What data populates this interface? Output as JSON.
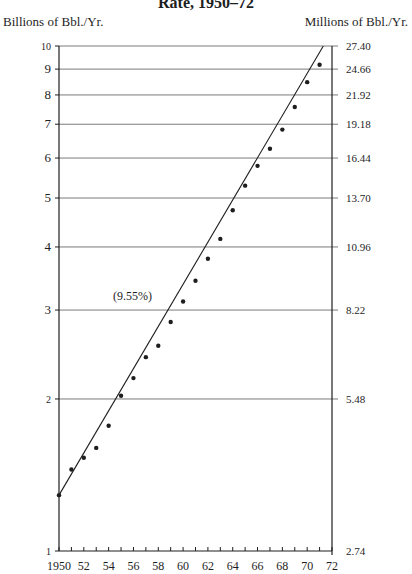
{
  "title": "Rate, 1950–72",
  "left_axis_title": "Billions of Bbl./Yr.",
  "right_axis_title": "Millions of Bbl./Yr.",
  "annotation": "(9.55%)",
  "colors": {
    "ink": "#1e1e1e",
    "grid": "#7a7a7a",
    "background": "#ffffff"
  },
  "chart_data": {
    "type": "scatter",
    "title": "Rate, 1950–72",
    "xlabel": "",
    "ylabel": "Billions of Bbl./Yr.",
    "ylabel_right": "Millions of Bbl./Yr.",
    "yscale": "log",
    "xlim": [
      1950,
      1972
    ],
    "ylim": [
      1,
      10
    ],
    "grid": "horizontal",
    "x_tick_labels": [
      "1950",
      "52",
      "54",
      "56",
      "58",
      "60",
      "62",
      "64",
      "66",
      "68",
      "70",
      "72"
    ],
    "x_ticks": [
      1950,
      1952,
      1954,
      1956,
      1958,
      1960,
      1962,
      1964,
      1966,
      1968,
      1970,
      1972
    ],
    "y_ticks_left": [
      1,
      2,
      3,
      4,
      5,
      6,
      7,
      8,
      9,
      10
    ],
    "y_tick_labels_left": [
      "1",
      "2",
      "3",
      "4",
      "5",
      "6",
      "7",
      "8",
      "9",
      "10"
    ],
    "y_tick_labels_right": [
      "2.74",
      "5.48",
      "8.22",
      "10.96",
      "13.70",
      "16.44",
      "19.18",
      "21.92",
      "24.66",
      "27.40"
    ],
    "series": [
      {
        "name": "Observed",
        "x": [
          1950,
          1951,
          1952,
          1953,
          1954,
          1955,
          1956,
          1957,
          1958,
          1959,
          1960,
          1961,
          1962,
          1963,
          1964,
          1965,
          1966,
          1967,
          1968,
          1969,
          1970,
          1971
        ],
        "values": [
          1.29,
          1.45,
          1.53,
          1.6,
          1.77,
          2.03,
          2.2,
          2.42,
          2.55,
          2.84,
          3.12,
          3.43,
          3.79,
          4.15,
          4.73,
          5.29,
          5.79,
          6.26,
          6.83,
          7.57,
          8.48,
          9.18
        ]
      },
      {
        "name": "Trend (9.55%)",
        "type": "line",
        "x": [
          1950,
          1971.3
        ],
        "values": [
          1.29,
          10.0
        ]
      }
    ],
    "annotations": [
      {
        "text": "(9.55%)",
        "x": 1957.5,
        "y": 3.2
      }
    ]
  }
}
